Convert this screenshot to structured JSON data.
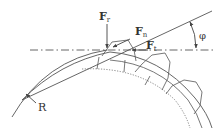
{
  "diagram": {
    "labels": {
      "radial_force": {
        "main": "F",
        "sub": "r"
      },
      "normal_force": {
        "main": "F",
        "sub": "n"
      },
      "tangential_force": {
        "main": "F",
        "sub": "t"
      },
      "pressure_angle": "φ",
      "radius": "R"
    },
    "colors": {
      "stroke": "#555555",
      "text": "#333333",
      "background": "#ffffff"
    }
  }
}
